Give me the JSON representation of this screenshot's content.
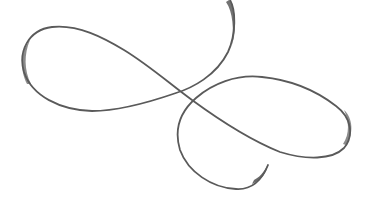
{
  "image": {
    "subject": "decorative calligraphic flourish",
    "background_color": "#ffffff",
    "stroke_color": "#5a5a5a",
    "width": 371,
    "height": 210
  }
}
